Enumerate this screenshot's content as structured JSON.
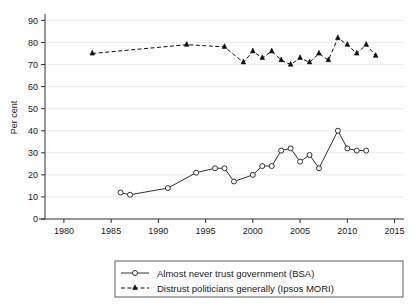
{
  "chart_data": {
    "type": "line",
    "title": "",
    "xlabel": "",
    "ylabel": "Per cent",
    "xlim": [
      1978,
      2016
    ],
    "ylim": [
      0,
      92
    ],
    "xticks": [
      1980,
      1985,
      1990,
      1995,
      2000,
      2005,
      2010,
      2015
    ],
    "yticks": [
      0,
      10,
      20,
      30,
      40,
      50,
      60,
      70,
      80,
      90
    ],
    "grid": true,
    "legend_position": "bottom-center",
    "series": [
      {
        "name": "Almost never trust government (BSA)",
        "marker": "open-circle",
        "linestyle": "solid",
        "color": "#333333",
        "points": [
          {
            "x": 1986,
            "y": 12
          },
          {
            "x": 1987,
            "y": 11
          },
          {
            "x": 1991,
            "y": 14
          },
          {
            "x": 1994,
            "y": 21
          },
          {
            "x": 1996,
            "y": 23
          },
          {
            "x": 1997,
            "y": 23
          },
          {
            "x": 1998,
            "y": 17
          },
          {
            "x": 2000,
            "y": 20
          },
          {
            "x": 2001,
            "y": 24
          },
          {
            "x": 2002,
            "y": 24
          },
          {
            "x": 2003,
            "y": 31
          },
          {
            "x": 2004,
            "y": 32
          },
          {
            "x": 2005,
            "y": 26
          },
          {
            "x": 2006,
            "y": 29
          },
          {
            "x": 2007,
            "y": 23
          },
          {
            "x": 2009,
            "y": 40
          },
          {
            "x": 2010,
            "y": 32
          },
          {
            "x": 2011,
            "y": 31
          },
          {
            "x": 2012,
            "y": 31
          }
        ]
      },
      {
        "name": "Distrust politicians generally (Ipsos MORI)",
        "marker": "filled-triangle",
        "linestyle": "dashed",
        "color": "#111111",
        "points": [
          {
            "x": 1983,
            "y": 75
          },
          {
            "x": 1993,
            "y": 79
          },
          {
            "x": 1997,
            "y": 78
          },
          {
            "x": 1999,
            "y": 71
          },
          {
            "x": 2000,
            "y": 76
          },
          {
            "x": 2001,
            "y": 73
          },
          {
            "x": 2002,
            "y": 76
          },
          {
            "x": 2003,
            "y": 72
          },
          {
            "x": 2004,
            "y": 70
          },
          {
            "x": 2005,
            "y": 73
          },
          {
            "x": 2006,
            "y": 71
          },
          {
            "x": 2007,
            "y": 75
          },
          {
            "x": 2008,
            "y": 72
          },
          {
            "x": 2009,
            "y": 82
          },
          {
            "x": 2010,
            "y": 79
          },
          {
            "x": 2011,
            "y": 75
          },
          {
            "x": 2012,
            "y": 79
          },
          {
            "x": 2013,
            "y": 74
          }
        ]
      }
    ]
  },
  "axis": {
    "ylabel": "Per cent",
    "ytick_labels": [
      "0",
      "10",
      "20",
      "30",
      "40",
      "50",
      "60",
      "70",
      "80",
      "90"
    ],
    "xtick_labels": [
      "1980",
      "1985",
      "1990",
      "1995",
      "2000",
      "2005",
      "2010",
      "2015"
    ]
  },
  "legend": {
    "entries": [
      {
        "label": "Almost never trust government (BSA)"
      },
      {
        "label": "Distrust politicians generally (Ipsos MORI)"
      }
    ]
  }
}
